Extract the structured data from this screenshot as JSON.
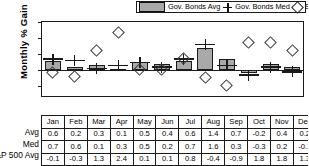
{
  "legend": {
    "bar_label": "Gov. Bonds Avg",
    "med_label": "Gov. Bonds Med",
    "dia_label": "S&P 500 Avg.",
    "bar_swatch_name": "bar-swatch",
    "med_marker_name": "plus-marker-icon",
    "dia_marker_name": "diamond-marker-icon"
  },
  "axis": {
    "ylabel": "Monthly % Gain",
    "yticks": [
      "3.0",
      "2.0",
      "1.0",
      "0.0",
      "-1.0"
    ]
  },
  "table": {
    "row_labels": [
      "Avg",
      "Med",
      "S&P 500 Avg"
    ]
  },
  "colors": {
    "bar_fill": "#a9a9a9",
    "outline": "#1a1a1a",
    "background": "#ffffff"
  },
  "chart_data": {
    "type": "bar",
    "title": "",
    "xlabel": "",
    "ylabel": "Monthly % Gain",
    "ylim": [
      -1.6,
      3.0
    ],
    "yticks": [
      3.0,
      2.0,
      1.0,
      0.0,
      -1.0
    ],
    "grid": false,
    "legend_position": "top",
    "categories": [
      "Jan",
      "Feb",
      "Mar",
      "Apr",
      "May",
      "Jun",
      "Jul",
      "Aug",
      "Sep",
      "Oct",
      "Nov",
      "Dec"
    ],
    "series": [
      {
        "name": "Gov. Bonds Avg",
        "type": "bar",
        "values": [
          0.6,
          0.2,
          0.3,
          0.1,
          0.5,
          0.4,
          0.6,
          1.4,
          0.7,
          -0.2,
          0.4,
          0.2
        ]
      },
      {
        "name": "Gov. Bonds Med",
        "type": "marker",
        "marker": "plus",
        "values": [
          0.7,
          0.6,
          0.1,
          0.3,
          0.5,
          0.2,
          0.7,
          1.6,
          0.3,
          -0.3,
          0.2,
          -0.1
        ]
      },
      {
        "name": "S&P 500 Avg.",
        "type": "marker",
        "marker": "diamond",
        "values": [
          -0.1,
          -0.3,
          1.3,
          2.4,
          0.1,
          0.1,
          0.8,
          -0.4,
          -0.9,
          1.8,
          1.8,
          1.3
        ]
      }
    ]
  }
}
